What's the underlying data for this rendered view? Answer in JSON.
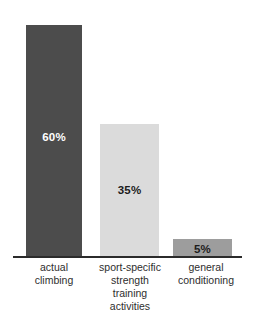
{
  "chart_data": {
    "type": "bar",
    "title": "",
    "subtitle": "",
    "xlabel": "",
    "ylabel": "",
    "ylim": [
      0,
      65
    ],
    "grid": false,
    "legend": "none",
    "categories": [
      "actual climbing",
      "sport-specific strength training activities",
      "general conditioning"
    ],
    "category_lines": [
      [
        "actual",
        "climbing"
      ],
      [
        "sport-specific",
        "strength",
        "training",
        "activities"
      ],
      [
        "general",
        "conditioning"
      ]
    ],
    "values": [
      60,
      35,
      5
    ],
    "value_labels": [
      "60%",
      "35%",
      "5%"
    ],
    "bar_colors": [
      "#4c4c4c",
      "#dbdbdb",
      "#9d9d9d"
    ],
    "value_label_colors": [
      "#ffffff",
      "#1c1c1c",
      "#1c1c1c"
    ],
    "axis_color": "#2b2b2b",
    "background_color": "#ffffff",
    "series": [
      {
        "name": "training time distribution",
        "values": [
          60,
          35,
          5
        ]
      }
    ]
  },
  "bars": [
    {
      "category": "actual climbing",
      "value_label": "60%",
      "line1": "actual",
      "line2": "climbing",
      "line3": "",
      "line4": ""
    },
    {
      "category": "sport-specific strength training activities",
      "value_label": "35%",
      "line1": "sport-specific",
      "line2": "strength",
      "line3": "training",
      "line4": "activities"
    },
    {
      "category": "general conditioning",
      "value_label": "5%",
      "line1": "general",
      "line2": "conditioning",
      "line3": "",
      "line4": ""
    }
  ]
}
